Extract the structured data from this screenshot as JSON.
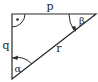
{
  "diagram": {
    "type": "right-triangle",
    "colors": {
      "stroke": "#2a2a2a",
      "background": "#ffffff"
    },
    "vertices": {
      "right_angle": [
        12,
        14
      ],
      "top_right": [
        96,
        14
      ],
      "bottom": [
        12,
        79
      ]
    },
    "sides": {
      "top": {
        "label": "p"
      },
      "left": {
        "label": "q"
      },
      "hypotenuse": {
        "label": "r"
      }
    },
    "angles": {
      "right_angle": {
        "marker": "dot"
      },
      "top_right": {
        "label": "β"
      },
      "bottom": {
        "label": "α"
      }
    }
  }
}
